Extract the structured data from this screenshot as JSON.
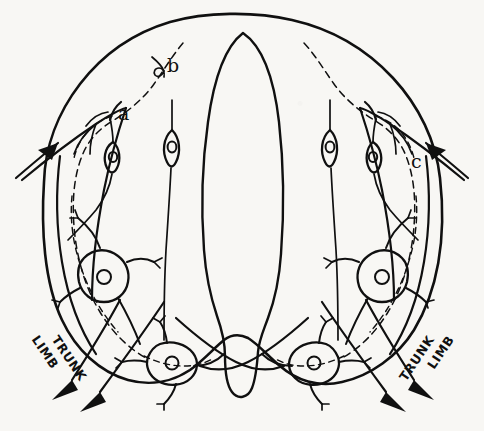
{
  "figure": {
    "type": "anatomical-line-drawing",
    "background_color": "#f8f7f4",
    "ink_color": "#101010"
  },
  "labels": {
    "a": "a",
    "b": "b",
    "c": "c"
  },
  "tracts": {
    "left_limb": "LIMB",
    "left_trunk": "TRUNK",
    "right_limb": "LIMB",
    "right_trunk": "TRUNK"
  },
  "arrows": {
    "upper_left": "afferent-inflow-arrow-left",
    "upper_right": "afferent-inflow-arrow-right",
    "lower_left_limb": "efferent-outflow-arrow-left-limb",
    "lower_left_trunk": "efferent-outflow-arrow-left-trunk",
    "lower_right_limb": "efferent-outflow-arrow-right-limb",
    "lower_right_trunk": "efferent-outflow-arrow-right-trunk"
  },
  "structures": {
    "outer_boundary": "cord-outline",
    "central_canal": "central-canal-lanceolate",
    "neurons": [
      {
        "id": "n-left-bipolar",
        "kind": "bipolar-cell",
        "side": "left",
        "region": "dorsal"
      },
      {
        "id": "n-left-mid-bipolar",
        "kind": "bipolar-cell",
        "side": "left",
        "region": "dorsal-medial"
      },
      {
        "id": "n-right-mid-bipolar",
        "kind": "bipolar-cell",
        "side": "right",
        "region": "dorsal-medial"
      },
      {
        "id": "n-right-bipolar",
        "kind": "bipolar-cell",
        "side": "right",
        "region": "dorsal"
      },
      {
        "id": "n-left-multipolar",
        "kind": "multipolar-cell",
        "side": "left",
        "region": "lateral"
      },
      {
        "id": "n-right-multipolar",
        "kind": "multipolar-cell",
        "side": "right",
        "region": "lateral"
      },
      {
        "id": "n-left-motor",
        "kind": "multipolar-motor-cell",
        "side": "left",
        "region": "ventral-horn"
      },
      {
        "id": "n-right-motor",
        "kind": "multipolar-motor-cell",
        "side": "right",
        "region": "ventral-horn"
      }
    ],
    "dashed_pathways": "collateral-fiber-pathways"
  }
}
